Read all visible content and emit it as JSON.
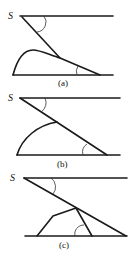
{
  "figure": {
    "panels": [
      {
        "id": "a",
        "label": "(a)",
        "source_label": "S",
        "shape": "curved-bump"
      },
      {
        "id": "b",
        "label": "(b)",
        "source_label": "S",
        "shape": "quarter-arc"
      },
      {
        "id": "c",
        "label": "(c)",
        "source_label": "S",
        "shape": "polygon"
      }
    ]
  }
}
